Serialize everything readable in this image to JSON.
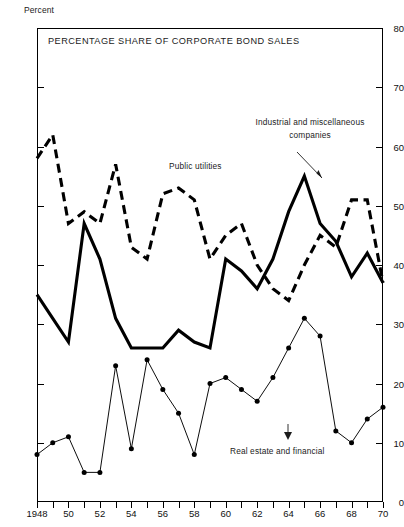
{
  "axis_name": "Percent",
  "chart_title": "PERCENTAGE SHARE OF CORPORATE BOND SALES",
  "annotations": {
    "public_utilities": "Public utilities",
    "industrial_line1": "Industrial and miscellaneous",
    "industrial_line2": "companies",
    "real_estate": "Real estate and financial"
  },
  "chart_data": {
    "type": "line",
    "title": "PERCENTAGE SHARE OF CORPORATE BOND SALES",
    "xlabel": "",
    "ylabel": "Percent",
    "xlim": [
      1948,
      1970
    ],
    "ylim": [
      0,
      80
    ],
    "grid": false,
    "legend": "inline-annotations",
    "ytick_labels": [
      "0",
      "10",
      "20",
      "30",
      "40",
      "50",
      "60",
      "70",
      "80"
    ],
    "ytick_values": [
      0,
      10,
      20,
      30,
      40,
      50,
      60,
      70,
      80
    ],
    "xtick_labels": [
      "1948",
      "50",
      "52",
      "54",
      "56",
      "58",
      "60",
      "62",
      "64",
      "66",
      "68",
      "70"
    ],
    "xtick_values": [
      1948,
      1950,
      1952,
      1954,
      1956,
      1958,
      1960,
      1962,
      1964,
      1966,
      1968,
      1970
    ],
    "x": [
      1948,
      1949,
      1950,
      1951,
      1952,
      1953,
      1954,
      1955,
      1956,
      1957,
      1958,
      1959,
      1960,
      1961,
      1962,
      1963,
      1964,
      1965,
      1966,
      1967,
      1968,
      1969,
      1970
    ],
    "series": [
      {
        "name": "Public utilities",
        "style": "dashed",
        "color": "#000000",
        "values": [
          58,
          62,
          47,
          49,
          47,
          57,
          43,
          41,
          52,
          53,
          51,
          41,
          45,
          47,
          40,
          36,
          34,
          40,
          45,
          43,
          51,
          51,
          37
        ]
      },
      {
        "name": "Industrial and miscellaneous companies",
        "style": "solid",
        "color": "#000000",
        "values": [
          35,
          31,
          27,
          47,
          41,
          31,
          26,
          26,
          26,
          29,
          27,
          26,
          41,
          39,
          36,
          41,
          49,
          55,
          47,
          44,
          38,
          42,
          37
        ]
      },
      {
        "name": "Real estate and financial",
        "style": "solid-thin-markers",
        "color": "#000000",
        "values": [
          8,
          10,
          11,
          5,
          5,
          23,
          9,
          24,
          19,
          15,
          8,
          20,
          21,
          19,
          17,
          21,
          26,
          31,
          28,
          12,
          10,
          14,
          16
        ]
      }
    ]
  }
}
